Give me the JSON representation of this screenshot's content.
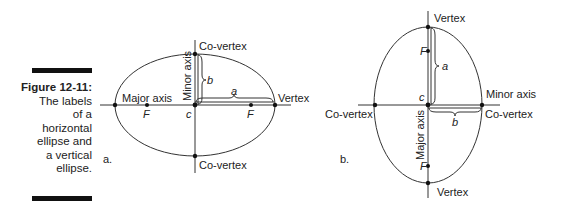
{
  "caption": {
    "title": "Figure 12-11:",
    "lines": [
      "The labels",
      "of a",
      "horizontal",
      "ellipse and",
      "a vertical",
      "ellipse."
    ]
  },
  "diagram_a": {
    "panel_label": "a.",
    "labels": {
      "top_covertex": "Co-vertex",
      "bottom_covertex": "Co-vertex",
      "vertex": "Vertex",
      "major_axis": "Major axis",
      "minor_axis": "Minor axis",
      "focus_left": "F",
      "focus_right": "F",
      "center": "c",
      "a": "a",
      "b": "b"
    }
  },
  "diagram_b": {
    "panel_label": "b.",
    "labels": {
      "top_vertex": "Vertex",
      "bottom_vertex": "Vertex",
      "left_covertex": "Co-vertex",
      "right_covertex": "Co-vertex",
      "major_axis": "Major axis",
      "minor_axis": "Minor axis",
      "focus_top": "F",
      "focus_bottom": "F",
      "center": "c",
      "a": "a",
      "b": "b"
    }
  }
}
